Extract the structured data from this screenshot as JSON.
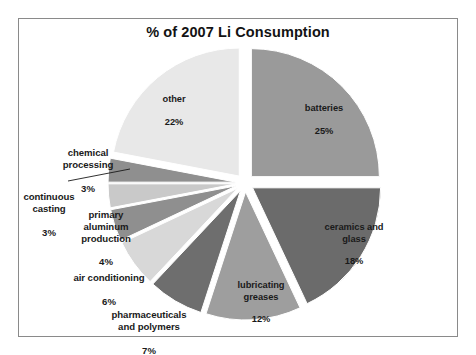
{
  "figure": {
    "background_color": "#ffffff",
    "border_color": "#8a8a8a"
  },
  "chart_data": {
    "type": "pie",
    "title": "% of 2007 Li Consumption",
    "xlabel": "",
    "ylabel": "",
    "units": "percent",
    "start_angle_deg": 0,
    "direction": "clockwise",
    "exploded": true,
    "legend": "none",
    "labels_position": "slice-and-outside",
    "categories": [
      "batteries",
      "ceramics and glass",
      "lubricating greases",
      "pharmaceuticals and polymers",
      "air conditioning",
      "primary aluminum production",
      "continuous casting",
      "chemical processing",
      "other"
    ],
    "values": [
      25,
      18,
      12,
      7,
      6,
      4,
      3,
      3,
      22
    ],
    "value_labels": [
      "25%",
      "18%",
      "12%",
      "7%",
      "6%",
      "4%",
      "3%",
      "3%",
      "22%"
    ],
    "colors": [
      "#9a9a9a",
      "#6b6b6b",
      "#9e9e9e",
      "#6e6e6e",
      "#d8d8d8",
      "#8f8f8f",
      "#c9c9c9",
      "#8f8f8f",
      "#e8e8e8"
    ],
    "total": 100
  },
  "labels": {
    "batteries": {
      "name": "batteries",
      "value": "25%"
    },
    "ceramics": {
      "name": "ceramics and\nglass",
      "value": "18%"
    },
    "greases": {
      "name": "lubricating\ngreases",
      "value": "12%"
    },
    "pharma": {
      "name": "pharmaceuticals\nand polymers",
      "value": "7%"
    },
    "aircon": {
      "name": "air conditioning",
      "value": "6%"
    },
    "aluminum": {
      "name": "primary\naluminum\nproduction",
      "value": "4%"
    },
    "casting": {
      "name": "continuous\ncasting",
      "value": "3%"
    },
    "chemical": {
      "name": "chemical\nprocessing",
      "value": "3%"
    },
    "other": {
      "name": "other",
      "value": "22%"
    }
  }
}
